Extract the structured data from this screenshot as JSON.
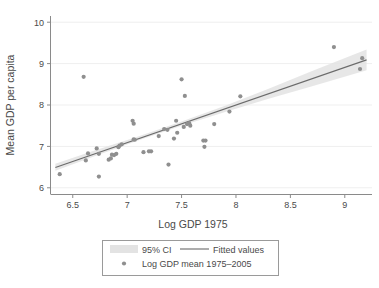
{
  "chart_data": {
    "type": "scatter",
    "title": "",
    "xlabel": "Log GDP 1975",
    "ylabel": "Mean GDP per capita",
    "xlim": [
      6.3,
      9.25
    ],
    "ylim": [
      5.85,
      10.15
    ],
    "xticks": [
      "6.5",
      "7",
      "7.5",
      "8",
      "8.5",
      "9"
    ],
    "xtick_values": [
      6.5,
      7,
      7.5,
      8,
      8.5,
      9
    ],
    "yticks": [
      "6",
      "7",
      "8",
      "9",
      "10"
    ],
    "ytick_values": [
      6,
      7,
      8,
      9,
      10
    ],
    "grid": "horizontal",
    "legend_position": "below-plot",
    "series": [
      {
        "name": "Log GDP mean 1975–2005",
        "type": "scatter",
        "marker_color": "#8f8f8f",
        "x": [
          6.38,
          6.6,
          6.62,
          6.64,
          6.72,
          6.74,
          6.74,
          6.83,
          6.85,
          6.86,
          6.88,
          6.9,
          6.92,
          6.93,
          6.95,
          7.05,
          7.06,
          7.06,
          7.07,
          7.15,
          7.2,
          7.22,
          7.29,
          7.34,
          7.37,
          7.38,
          7.43,
          7.45,
          7.46,
          7.5,
          7.52,
          7.53,
          7.55,
          7.57,
          7.58,
          7.7,
          7.71,
          7.72,
          7.8,
          7.94,
          8.04,
          8.9,
          9.14,
          9.16
        ],
        "y": [
          6.33,
          8.68,
          6.66,
          6.83,
          6.95,
          6.82,
          6.27,
          6.68,
          6.71,
          6.8,
          6.79,
          6.82,
          6.98,
          7.02,
          7.05,
          7.62,
          7.55,
          7.17,
          7.16,
          6.86,
          6.88,
          6.88,
          7.25,
          7.42,
          7.4,
          6.56,
          7.19,
          7.62,
          7.33,
          8.62,
          7.47,
          8.22,
          7.54,
          7.56,
          7.5,
          7.14,
          6.99,
          7.14,
          7.54,
          7.84,
          8.21,
          9.4,
          8.87,
          9.13
        ]
      },
      {
        "name": "Fitted values",
        "type": "line",
        "line_color": "#6b6b6b",
        "x": [
          6.34,
          9.2
        ],
        "y": [
          6.49,
          9.09
        ]
      },
      {
        "name": "95% CI",
        "type": "band",
        "band_color": "#e3e3e3",
        "x": [
          6.34,
          6.7,
          7.1,
          7.5,
          7.9,
          8.3,
          8.7,
          9.2
        ],
        "y_lower": [
          6.41,
          6.76,
          7.14,
          7.5,
          7.83,
          8.15,
          8.45,
          8.84
        ],
        "y_upper": [
          6.58,
          6.9,
          7.24,
          7.6,
          7.98,
          8.39,
          8.82,
          9.34
        ]
      }
    ]
  },
  "legend": {
    "ci_label": "95% CI",
    "fitted_label": "Fitted values",
    "points_label": "Log GDP mean 1975–2005"
  },
  "colors": {
    "marker": "#8f8f8f",
    "line": "#6b6b6b",
    "band": "#e3e3e3",
    "grid": "#efefef",
    "axis": "#8a8a8a",
    "text": "#4a4a4a"
  }
}
